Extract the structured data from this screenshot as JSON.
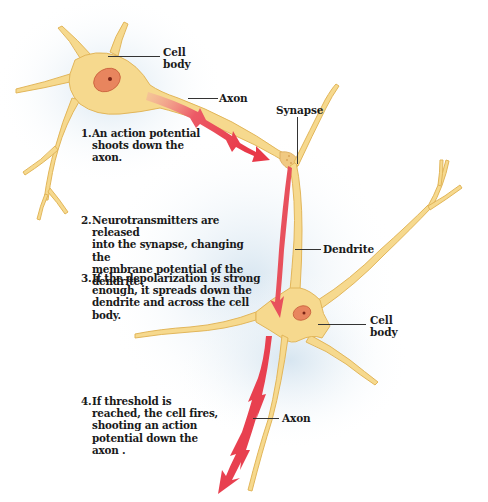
{
  "diagram": {
    "type": "neuron signal transmission",
    "colors": {
      "neuron_fill": "#f6d98e",
      "neuron_outline": "#e2b65a",
      "nucleus": "#e07a55",
      "nucleolus": "#8a2a1a",
      "signal_arrow": "#e8404f",
      "shadow": "#dce8f2",
      "text": "#1a1a1a"
    },
    "labels": {
      "cell_body_top": [
        "Cell",
        "body"
      ],
      "axon_top": "Axon",
      "synapse": "Synapse",
      "dendrite": "Dendrite",
      "cell_body_bottom": [
        "Cell",
        "body"
      ],
      "axon_bottom": "Axon"
    },
    "steps": [
      {
        "number": "1.",
        "text": [
          "An action potential",
          "shoots down the",
          "axon."
        ]
      },
      {
        "number": "2.",
        "text": [
          "Neurotransmitters are released",
          "into the synapse, changing the",
          "membrane potential of the",
          "dendrite."
        ]
      },
      {
        "number": "3.",
        "text": [
          "If the depolarization is strong",
          "enough, it spreads down the",
          "dendrite and across the cell",
          "body."
        ]
      },
      {
        "number": "4.",
        "text": [
          "If threshold is",
          "reached, the cell fires,",
          "shooting an action",
          "potential down the",
          "axon ."
        ]
      }
    ]
  }
}
